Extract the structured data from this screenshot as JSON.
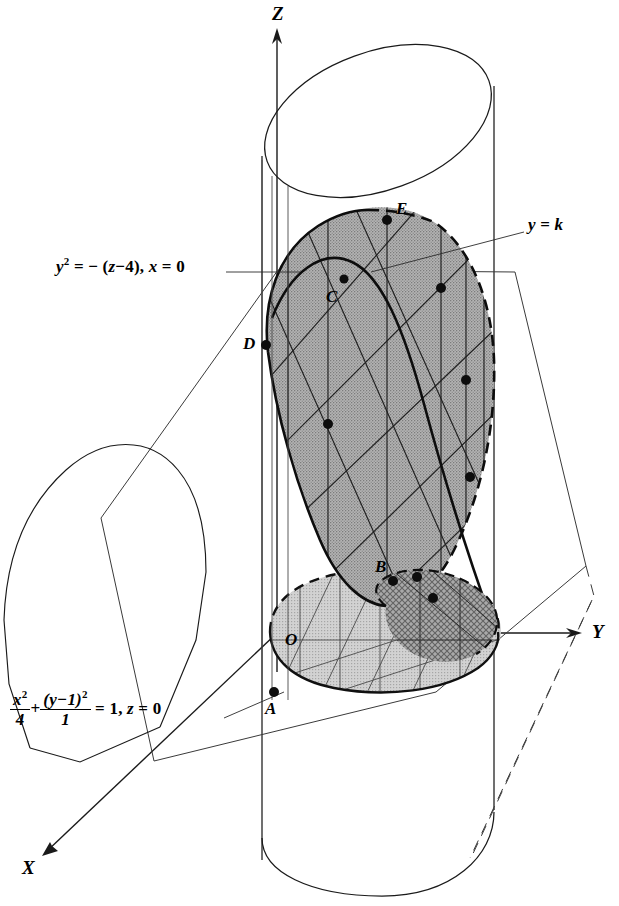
{
  "figure": {
    "background_color": "#ffffff",
    "ink_color": "#000000",
    "surface_fill": "#a8a8a8",
    "base_fill": "#c9c9c9",
    "overlap_fill": "#8e8e8e"
  },
  "axes": [
    {
      "name": "z-axis",
      "label": "Z",
      "label_x": 272,
      "label_y": 8,
      "direction": "up"
    },
    {
      "name": "y-axis",
      "label": "Y",
      "label_x": 592,
      "label_y": 622,
      "direction": "right"
    },
    {
      "name": "x-axis",
      "label": "X",
      "label_x": 22,
      "label_y": 864,
      "direction": "down-left"
    }
  ],
  "points": [
    {
      "label": "A",
      "label_x": 265,
      "label_y": 700,
      "dot_x": 274,
      "dot_y": 692
    },
    {
      "label": "B",
      "label_x": 377,
      "label_y": 561,
      "dot_x": 393,
      "dot_y": 581
    },
    {
      "label": "C",
      "label_x": 326,
      "label_y": 290,
      "dot_x": 344,
      "dot_y": 279
    },
    {
      "label": "D",
      "label_x": 243,
      "label_y": 337,
      "dot_x": 266,
      "dot_y": 345
    },
    {
      "label": "E",
      "label_x": 396,
      "label_y": 203,
      "dot_x": 387,
      "dot_y": 220
    },
    {
      "label": "O",
      "label_x": 285,
      "label_y": 633,
      "dot_x": null,
      "dot_y": null
    }
  ],
  "annotations": [
    {
      "name": "parabola-equation",
      "text_plain": "y^2 = -(z-4), x = 0",
      "x": 56,
      "y": 264,
      "leader_from": [
        225,
        272
      ],
      "leader_to": [
        296,
        272
      ]
    },
    {
      "name": "ellipse-equation",
      "text_plain": "x^2/4 + (y-1)^2/1 = 1, z = 0",
      "x": 10,
      "y": 706,
      "leader_from": [
        224,
        717
      ],
      "leader_to": [
        281,
        693
      ]
    },
    {
      "name": "plane-label",
      "text_plain": "y = k",
      "x": 528,
      "y": 219,
      "leader_from": [
        524,
        232
      ],
      "leader_to": [
        371,
        272
      ]
    }
  ],
  "equation_parts": {
    "parabola": {
      "y": "y",
      "exp2": "2",
      "eq": " = − (",
      "z": "z",
      "minus4": "−4",
      "close": "), ",
      "x": "x",
      "eq0": " = 0"
    },
    "ellipse": {
      "x": "x",
      "exp2": "2",
      "den4": "4",
      "plus": "+",
      "numy": "(y−1)",
      "expn2": "2",
      "den1": "1",
      "eq1": " = 1, ",
      "z": "z",
      "eq0": " = 0"
    },
    "plane": {
      "y": "y",
      "eq": " = ",
      "k": "k"
    }
  },
  "curve_dots": [
    [
      274,
      692
    ],
    [
      393,
      581
    ],
    [
      344,
      279
    ],
    [
      266,
      345
    ],
    [
      387,
      220
    ],
    [
      441,
      288
    ],
    [
      328,
      424
    ],
    [
      462,
      380
    ],
    [
      466,
      477
    ],
    [
      417,
      577
    ],
    [
      433,
      598
    ],
    [
      469,
      444
    ]
  ]
}
